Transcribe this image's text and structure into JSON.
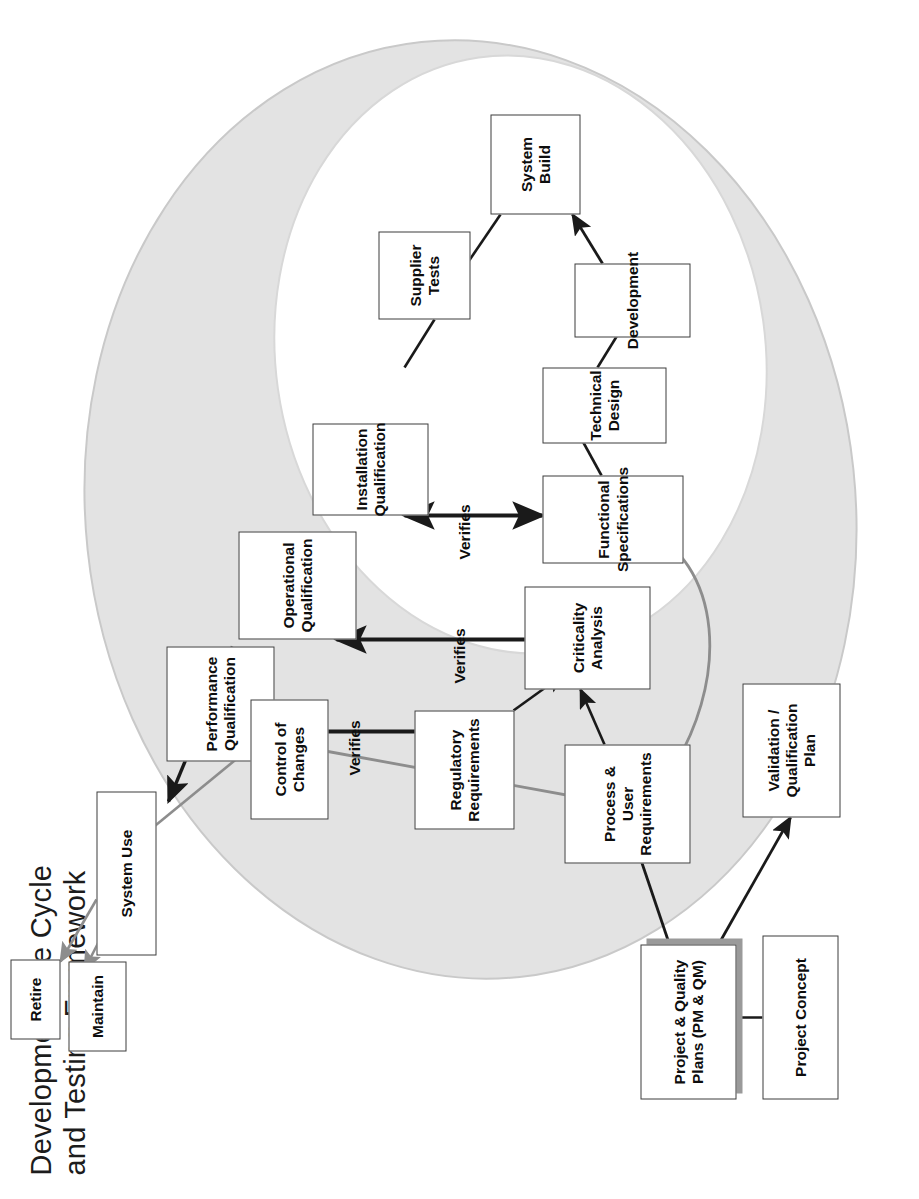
{
  "title": {
    "line1": "Development Life Cycle",
    "line2": "and Testing Framework",
    "full": "Development Life Cycle\nand Testing Framework"
  },
  "zones": [
    {
      "id": "project",
      "label": "PROJECT"
    },
    {
      "id": "supplier",
      "label": "SUPPLIER /\nINTERNAL\nDEVELOPMENT"
    }
  ],
  "boxes": [
    {
      "id": "project-concept",
      "label": "Project Concept"
    },
    {
      "id": "project-quality-plans",
      "label": "Project & Quality\nPlans (PM & QM)"
    },
    {
      "id": "validation-plan",
      "label": "Validation /\nQualification\nPlan"
    },
    {
      "id": "process-user-req",
      "label": "Process &\nUser Requirements"
    },
    {
      "id": "regulatory-req",
      "label": "Regulatory\nRequirements"
    },
    {
      "id": "criticality-analysis",
      "label": "Criticality\nAnalysis"
    },
    {
      "id": "functional-specs",
      "label": "Functional\nSpecifications"
    },
    {
      "id": "technical-design",
      "label": "Technical Design"
    },
    {
      "id": "development",
      "label": "Development"
    },
    {
      "id": "system-build",
      "label": "System Build"
    },
    {
      "id": "supplier-tests",
      "label": "Supplier\nTests"
    },
    {
      "id": "installation-qual",
      "label": "Installation\nQualification"
    },
    {
      "id": "operational-qual",
      "label": "Operational\nQualification"
    },
    {
      "id": "performance-qual",
      "label": "Performance\nQualification"
    },
    {
      "id": "control-of-changes",
      "label": "Control of\nChanges"
    },
    {
      "id": "system-use",
      "label": "System Use"
    },
    {
      "id": "maintain",
      "label": "Maintain"
    },
    {
      "id": "retire",
      "label": "Retire"
    }
  ],
  "verifies": [
    {
      "id": "verifies-pq",
      "label": "Verifies"
    },
    {
      "id": "verifies-oq",
      "label": "Verifies"
    },
    {
      "id": "verifies-iq",
      "label": "Verifies"
    }
  ],
  "colors": {
    "outer_ellipse_fill": "#e3e3e3",
    "inner_ellipse_fill": "#ffffff",
    "box_border": "#3d3d3d",
    "box_fill": "#ffffff",
    "arrow_dark": "#1a1a1a",
    "arrow_grey": "#8d8d8d",
    "shadow": "#9a9a9a",
    "text": "#0d0d0d",
    "background": "#ffffff"
  }
}
